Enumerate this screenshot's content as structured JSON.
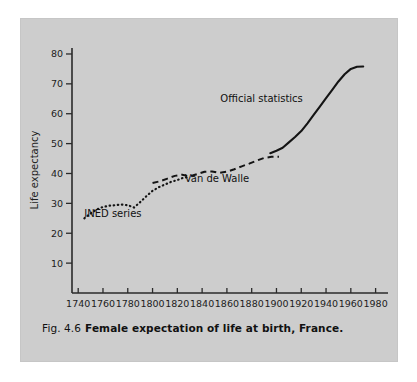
{
  "caption": {
    "figure_number": "Fig. 4.6",
    "title": "Female expectation of life at birth, France."
  },
  "chart_data": {
    "type": "line",
    "title": "Female expectation of life at birth, France.",
    "xlabel": "",
    "ylabel": "Life expectancy",
    "xlim": [
      1735,
      1990
    ],
    "ylim": [
      0,
      82
    ],
    "grid": false,
    "legend": "inline-annotations",
    "xticks": [
      1740,
      1760,
      1780,
      1800,
      1820,
      1840,
      1860,
      1880,
      1900,
      1920,
      1940,
      1960,
      1980
    ],
    "yticks": [
      10,
      20,
      30,
      40,
      50,
      60,
      70,
      80
    ],
    "xtick_labels": [
      "1740",
      "1760",
      "1780",
      "1800",
      "1820",
      "1840",
      "1860",
      "1880",
      "1900",
      "1920",
      "1940",
      "1960",
      "1980"
    ],
    "ytick_labels": [
      "10",
      "20",
      "30",
      "40",
      "50",
      "60",
      "70",
      "80"
    ],
    "series": [
      {
        "name": "INED series",
        "style": "dotted",
        "label_x": 1768,
        "label_y": 25.5,
        "x": [
          1745,
          1750,
          1755,
          1760,
          1765,
          1770,
          1775,
          1780,
          1785,
          1790,
          1795,
          1800,
          1805,
          1810,
          1815,
          1820,
          1825,
          1830
        ],
        "y": [
          25.0,
          26.6,
          28.0,
          28.8,
          29.2,
          29.4,
          29.6,
          29.4,
          28.6,
          30.4,
          32.4,
          34.2,
          35.4,
          36.3,
          37.2,
          37.8,
          38.6,
          38.8
        ]
      },
      {
        "name": "Van de Walle",
        "style": "dashed",
        "label_x": 1852,
        "label_y": 37.0,
        "x": [
          1800,
          1806,
          1812,
          1818,
          1824,
          1830,
          1836,
          1842,
          1848,
          1854,
          1860,
          1866,
          1872,
          1878,
          1884,
          1890,
          1896,
          1902
        ],
        "y": [
          36.8,
          37.4,
          38.3,
          39.2,
          39.6,
          39.0,
          39.8,
          40.6,
          40.7,
          40.2,
          40.6,
          41.4,
          42.4,
          43.3,
          44.3,
          45.2,
          45.6,
          45.6
        ]
      },
      {
        "name": "Official statistics",
        "style": "solid",
        "label_x": 1888,
        "label_y": 64.0,
        "x": [
          1895,
          1900,
          1905,
          1910,
          1915,
          1920,
          1925,
          1930,
          1935,
          1940,
          1945,
          1950,
          1955,
          1960,
          1965,
          1970
        ],
        "y": [
          46.8,
          47.6,
          48.6,
          50.4,
          52.2,
          54.2,
          56.8,
          59.6,
          62.4,
          65.2,
          68.0,
          70.8,
          73.2,
          75.0,
          75.7,
          75.8
        ]
      }
    ]
  }
}
